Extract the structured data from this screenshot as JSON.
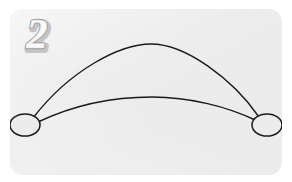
{
  "card": {
    "background_color": "#ececec",
    "corner_radius_px": 13,
    "x": 10,
    "y": 9,
    "width": 272,
    "height": 166
  },
  "badge": {
    "label": "2",
    "style": "outlined-embossed-numeral",
    "fill_color": "#f5f5f5",
    "outline_color": "#9a9a9a",
    "shadow_color": "#bdbdbd"
  },
  "diagram": {
    "type": "multigraph",
    "stroke_color": "#1a1a1a",
    "stroke_width": 1.4,
    "node_fill": "#ececec",
    "nodes": [
      {
        "id": "node-left",
        "label": "",
        "cx": 25,
        "cy": 125,
        "rx": 15,
        "ry": 11
      },
      {
        "id": "node-right",
        "label": "",
        "cx": 267,
        "cy": 125,
        "rx": 15,
        "ry": 11
      }
    ],
    "edges": [
      {
        "id": "edge-upper",
        "from": "node-left",
        "to": "node-right",
        "path": "M 33 118 C 70 70, 120 44, 151 44 C 185 44, 232 78, 259 117"
      },
      {
        "id": "edge-lower",
        "from": "node-left",
        "to": "node-right",
        "path": "M 38 122 C 80 102, 120 97, 152 97 C 190 97, 228 107, 255 120"
      }
    ]
  }
}
